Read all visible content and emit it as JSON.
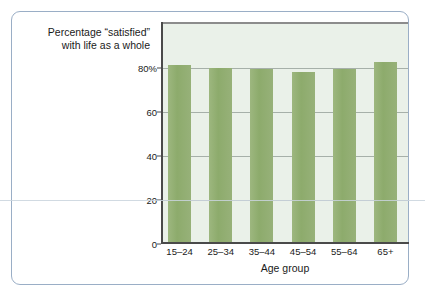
{
  "figure": {
    "caption_line1": "Percentage “satisfied”",
    "caption_line2": "with life as a whole",
    "card_border_color": "#9aaec6",
    "plot_background": "#eaf1e9",
    "bar_color": "#93ae75",
    "gridline_color": "#8f9a93",
    "axis_color": "#4a4a4a"
  },
  "chart_data": {
    "type": "bar",
    "title": "",
    "subtitle": "",
    "categories": [
      "15–24",
      "25–34",
      "35–44",
      "45–54",
      "55–64",
      "65+"
    ],
    "values": [
      80.5,
      79,
      78.5,
      77.5,
      78.5,
      82
    ],
    "xlabel": "Age group",
    "ylabel": "Percentage “satisfied” with life as a whole",
    "ylim": [
      0,
      100
    ],
    "ytick_values": [
      0,
      20,
      40,
      60,
      80
    ],
    "ytick_labels": [
      "0",
      "20",
      "40",
      "60",
      "80%"
    ],
    "grid": true,
    "legend": "none",
    "annotations": []
  }
}
